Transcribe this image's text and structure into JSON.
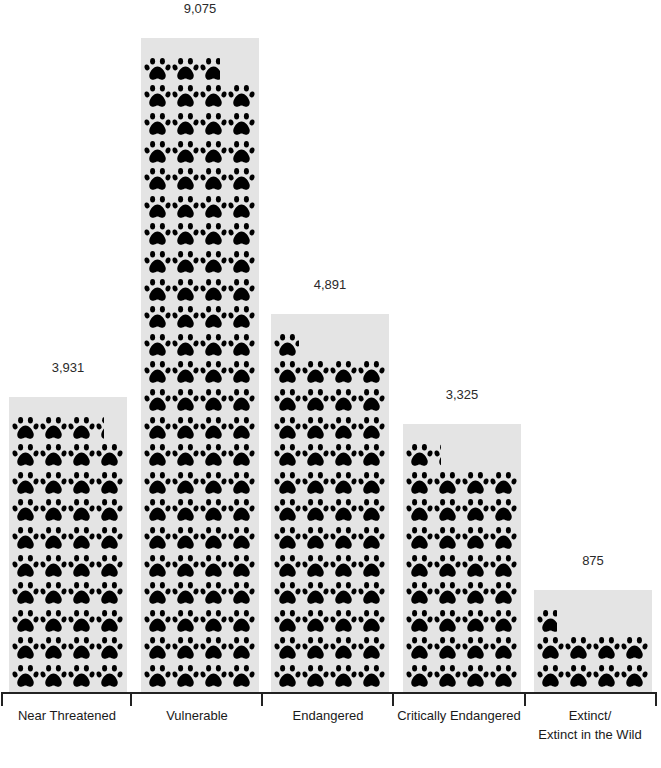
{
  "chart_data": {
    "type": "bar",
    "subtype": "pictograph",
    "title": "",
    "xlabel": "",
    "ylabel": "",
    "unit_per_icon": 100,
    "icons_per_row": 4,
    "icon": "paw-print-icon",
    "categories": [
      "Near Threatened",
      "Vulnerable",
      "Endangered",
      "Critically Endangered",
      "Extinct/ Extinct in the Wild"
    ],
    "values": [
      3931,
      9075,
      4891,
      3325,
      875
    ],
    "value_labels": [
      "3,931",
      "9,075",
      "4,891",
      "3,325",
      "875"
    ],
    "grid": false,
    "legend": null,
    "colors": {
      "bar_background": "#e4e4e4",
      "icon": "#000000",
      "axis": "#222222"
    }
  },
  "labels": {
    "cat0": "Near Threatened",
    "cat1": "Vulnerable",
    "cat2": "Endangered",
    "cat3": "Critically Endangered",
    "cat4_line1": "Extinct/",
    "cat4_line2": "Extinct in the Wild",
    "val0": "3,931",
    "val1": "9,075",
    "val2": "4,891",
    "val3": "3,325",
    "val4": "875"
  }
}
